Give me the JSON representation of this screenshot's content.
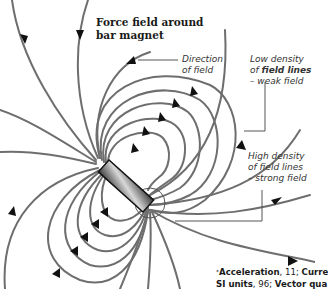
{
  "figure": {
    "title_line1": "Force field around",
    "title_line2": "bar magnet",
    "labels": {
      "direction": {
        "line1": "Direction",
        "line2": "of field"
      },
      "low_density": {
        "line1": "Low density",
        "line2_prefix": "of ",
        "line2_bold": "field lines",
        "line3": "– weak field"
      },
      "high_density": {
        "line1": "High density",
        "line2": "of field lines",
        "line3": "– strong field"
      }
    },
    "footer": {
      "star": "*",
      "line1": [
        {
          "text": "Acceleration",
          "bold": true
        },
        {
          "text": ", 11; ",
          "bold": false
        },
        {
          "text": "Curre",
          "bold": true
        }
      ],
      "line2": [
        {
          "text": "SI units",
          "bold": true
        },
        {
          "text": ", 96; ",
          "bold": false
        },
        {
          "text": "Vector qua",
          "bold": true
        }
      ]
    },
    "colors": {
      "field_line": "#6e6e6e",
      "arrow": "#111111",
      "magnet_dark": "#3a3a3a",
      "magnet_light": "#d8d8d8",
      "leader_line": "#555555"
    },
    "icons": {
      "magnet": "bar-magnet-icon",
      "arrowheads": "direction-arrow-icon"
    }
  }
}
